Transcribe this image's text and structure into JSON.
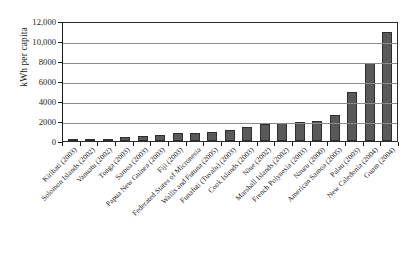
{
  "chart_data": {
    "type": "bar",
    "title": "",
    "xlabel": "",
    "ylabel": "kWh per capita",
    "ylim": [
      0,
      12000
    ],
    "ytick_labels": [
      "12,000",
      "10,000",
      "8000",
      "6000",
      "4000",
      "2000",
      "0"
    ],
    "ytick_values": [
      12000,
      10000,
      8000,
      6000,
      4000,
      2000,
      0
    ],
    "grid": true,
    "legend": "none",
    "bar_color": "#595959",
    "bar_edge_color": "#2e2e2e",
    "categories": [
      "Kiribati (2003)",
      "Solomon Islands (2002)",
      "Vanuatu (2002)",
      "Tonga (2003)",
      "Samoa (2003)",
      "Papua New Guinea (2003)",
      "Fiji (2003)",
      "Federated States of Micronesia",
      "Wallis and Futuna (2005)",
      "Funafuti (Tuvalu) (2003)",
      "Cook Islands (2003)",
      "Niue (2002)",
      "Marshall Islands (2002)",
      "French Polynesia (2003)",
      "Nauru (2000)",
      "American Samoa (2005)",
      "Palau (2003)",
      "New Caledonia (2004)",
      "Guam (2004)"
    ],
    "values": [
      170,
      220,
      230,
      360,
      540,
      600,
      800,
      840,
      900,
      1060,
      1400,
      1700,
      1800,
      1900,
      2050,
      2600,
      4900,
      7800,
      10900
    ]
  }
}
